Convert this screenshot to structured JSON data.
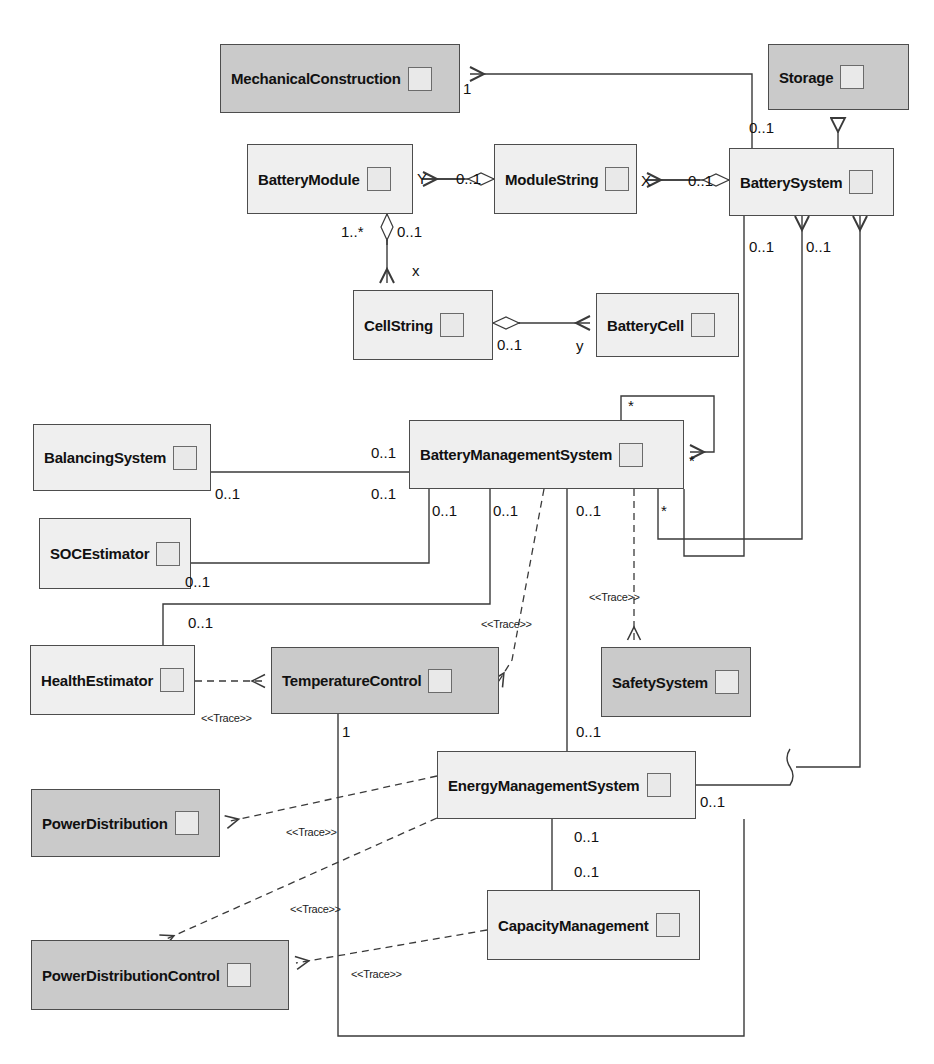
{
  "diagram": {
    "type": "uml-class-diagram",
    "colors": {
      "line": "#3a3a3a",
      "box_light": "#efefef",
      "box_dark": "#cacaca",
      "border": "#4d4d4d",
      "stub": "#e9e9e9"
    }
  },
  "classes": [
    {
      "id": "mechanicalconstruction",
      "name": "MechanicalConstruction",
      "shade": "dark",
      "x": 220,
      "y": 44,
      "w": 240,
      "h": 69
    },
    {
      "id": "storage",
      "name": "Storage",
      "shade": "dark",
      "x": 768,
      "y": 44,
      "w": 141,
      "h": 66
    },
    {
      "id": "batterymodule",
      "name": "BatteryModule",
      "shade": "light",
      "x": 247,
      "y": 144,
      "w": 166,
      "h": 70
    },
    {
      "id": "modulestring",
      "name": "ModuleString",
      "shade": "light",
      "x": 494,
      "y": 144,
      "w": 143,
      "h": 70
    },
    {
      "id": "batterysystem",
      "name": "BatterySystem",
      "shade": "light",
      "x": 729,
      "y": 148,
      "w": 165,
      "h": 68
    },
    {
      "id": "cellstring",
      "name": "CellString",
      "shade": "light",
      "x": 353,
      "y": 290,
      "w": 140,
      "h": 70
    },
    {
      "id": "batterycell",
      "name": "BatteryCell",
      "shade": "light",
      "x": 596,
      "y": 293,
      "w": 143,
      "h": 64
    },
    {
      "id": "balancingsystem",
      "name": "BalancingSystem",
      "shade": "light",
      "x": 33,
      "y": 424,
      "w": 178,
      "h": 67
    },
    {
      "id": "batterymanagementsystem",
      "name": "BatteryManagementSystem",
      "shade": "light",
      "x": 409,
      "y": 420,
      "w": 275,
      "h": 69
    },
    {
      "id": "socestimator",
      "name": "SOCEstimator",
      "shade": "light",
      "x": 39,
      "y": 518,
      "w": 152,
      "h": 71
    },
    {
      "id": "healthestimator",
      "name": "HealthEstimator",
      "shade": "light",
      "x": 30,
      "y": 645,
      "w": 165,
      "h": 70
    },
    {
      "id": "temperaturecontrol",
      "name": "TemperatureControl",
      "shade": "dark",
      "x": 271,
      "y": 647,
      "w": 228,
      "h": 67
    },
    {
      "id": "safetysystem",
      "name": "SafetySystem",
      "shade": "dark",
      "x": 601,
      "y": 647,
      "w": 150,
      "h": 70
    },
    {
      "id": "powerdistribution",
      "name": "PowerDistribution",
      "shade": "dark",
      "x": 31,
      "y": 789,
      "w": 189,
      "h": 68
    },
    {
      "id": "energymanagementsystem",
      "name": "EnergyManagementSystem",
      "shade": "light",
      "x": 437,
      "y": 751,
      "w": 259,
      "h": 68
    },
    {
      "id": "capacitymanagement",
      "name": "CapacityManagement",
      "shade": "light",
      "x": 487,
      "y": 890,
      "w": 213,
      "h": 70
    },
    {
      "id": "powerdistributioncontrol",
      "name": "PowerDistributionControl",
      "shade": "dark",
      "x": 31,
      "y": 940,
      "w": 258,
      "h": 70
    }
  ],
  "multiplicities": [
    {
      "text": "1",
      "x": 463,
      "y": 80
    },
    {
      "text": "0..1",
      "x": 749,
      "y": 119
    },
    {
      "text": "Y",
      "x": 417,
      "y": 170
    },
    {
      "text": "0..1",
      "x": 456,
      "y": 170
    },
    {
      "text": "X",
      "x": 641,
      "y": 172
    },
    {
      "text": "0..1",
      "x": 688,
      "y": 172
    },
    {
      "text": "1..*",
      "x": 341,
      "y": 223
    },
    {
      "text": "0..1",
      "x": 397,
      "y": 223
    },
    {
      "text": "x",
      "x": 412,
      "y": 262
    },
    {
      "text": "0..1",
      "x": 749,
      "y": 238
    },
    {
      "text": "0..1",
      "x": 806,
      "y": 238
    },
    {
      "text": "0..1",
      "x": 497,
      "y": 336
    },
    {
      "text": "y",
      "x": 576,
      "y": 337
    },
    {
      "text": "*",
      "x": 628,
      "y": 397
    },
    {
      "text": "*",
      "x": 689,
      "y": 452
    },
    {
      "text": "0..1",
      "x": 371,
      "y": 444
    },
    {
      "text": "0..1",
      "x": 215,
      "y": 485
    },
    {
      "text": "0..1",
      "x": 371,
      "y": 485
    },
    {
      "text": "0..1",
      "x": 432,
      "y": 502
    },
    {
      "text": "0..1",
      "x": 493,
      "y": 502
    },
    {
      "text": "0..1",
      "x": 576,
      "y": 502
    },
    {
      "text": "*",
      "x": 661,
      "y": 502
    },
    {
      "text": "0..1",
      "x": 185,
      "y": 573
    },
    {
      "text": "0..1",
      "x": 188,
      "y": 614
    },
    {
      "text": "1",
      "x": 342,
      "y": 723
    },
    {
      "text": "0..1",
      "x": 576,
      "y": 723
    },
    {
      "text": "0..1",
      "x": 700,
      "y": 793
    },
    {
      "text": "0..1",
      "x": 574,
      "y": 828
    },
    {
      "text": "0..1",
      "x": 574,
      "y": 863
    }
  ],
  "stereotypes": [
    {
      "text": "<<Trace>>",
      "x": 481,
      "y": 618
    },
    {
      "text": "<<Trace>>",
      "x": 589,
      "y": 591
    },
    {
      "text": "<<Trace>>",
      "x": 201,
      "y": 712
    },
    {
      "text": "<<Trace>>",
      "x": 286,
      "y": 826
    },
    {
      "text": "<<Trace>>",
      "x": 290,
      "y": 903
    },
    {
      "text": "<<Trace>>",
      "x": 351,
      "y": 968
    }
  ],
  "relationships": [
    {
      "from": "batterysystem",
      "to": "mechanicalconstruction",
      "kind": "association",
      "source_mult": "0..1",
      "target_mult": "1"
    },
    {
      "from": "batterysystem",
      "to": "storage",
      "kind": "generalization"
    },
    {
      "from": "batterysystem",
      "to": "modulestring",
      "kind": "aggregation",
      "source_mult": "0..1",
      "target_mult": "X"
    },
    {
      "from": "modulestring",
      "to": "batterymodule",
      "kind": "aggregation",
      "source_mult": "0..1",
      "target_mult": "Y"
    },
    {
      "from": "batterymodule",
      "to": "cellstring",
      "kind": "aggregation",
      "source_mult": "1..*",
      "target_mult": "0..1",
      "role": "x"
    },
    {
      "from": "cellstring",
      "to": "batterycell",
      "kind": "aggregation",
      "source_mult": "0..1",
      "target_mult": "y"
    },
    {
      "from": "batterysystem",
      "to": "batterymanagementsystem",
      "kind": "association",
      "source_mult": "0..1",
      "target_mult": "0..1"
    },
    {
      "from": "batterymanagementsystem",
      "to": "batterymanagementsystem",
      "kind": "association",
      "source_mult": "*",
      "target_mult": "*"
    },
    {
      "from": "batterymanagementsystem",
      "to": "balancingsystem",
      "kind": "association",
      "source_mult": "0..1",
      "target_mult": "0..1"
    },
    {
      "from": "batterymanagementsystem",
      "to": "socestimator",
      "kind": "association",
      "source_mult": "0..1",
      "target_mult": "0..1"
    },
    {
      "from": "batterymanagementsystem",
      "to": "healthestimator",
      "kind": "association",
      "source_mult": "0..1",
      "target_mult": "0..1"
    },
    {
      "from": "batterymanagementsystem",
      "to": "temperaturecontrol",
      "kind": "trace"
    },
    {
      "from": "batterymanagementsystem",
      "to": "safetysystem",
      "kind": "trace"
    },
    {
      "from": "batterymanagementsystem",
      "to": "energymanagementsystem",
      "kind": "association",
      "source_mult": "0..1",
      "target_mult": "0..1"
    },
    {
      "from": "healthestimator",
      "to": "temperaturecontrol",
      "kind": "trace"
    },
    {
      "from": "temperaturecontrol",
      "to": "energymanagementsystem",
      "kind": "association",
      "source_mult": "1"
    },
    {
      "from": "energymanagementsystem",
      "to": "powerdistribution",
      "kind": "trace"
    },
    {
      "from": "energymanagementsystem",
      "to": "powerdistributioncontrol",
      "kind": "trace"
    },
    {
      "from": "capacitymanagement",
      "to": "powerdistributioncontrol",
      "kind": "trace"
    },
    {
      "from": "energymanagementsystem",
      "to": "capacitymanagement",
      "kind": "association",
      "source_mult": "0..1",
      "target_mult": "0..1"
    },
    {
      "from": "energymanagementsystem",
      "to": "batterysystem",
      "kind": "association",
      "source_mult": "0..1"
    }
  ]
}
